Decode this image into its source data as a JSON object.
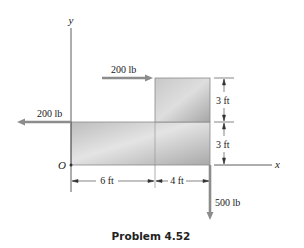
{
  "figure": {
    "caption": "Problem 4.52",
    "axes": {
      "x_label": "x",
      "y_label": "y",
      "origin_label": "O"
    },
    "forces": [
      {
        "id": "top-horizontal",
        "label": "200 lb",
        "direction": "right"
      },
      {
        "id": "left-horizontal",
        "label": "200 lb",
        "direction": "left"
      },
      {
        "id": "bottom-vertical",
        "label": "500 lb",
        "direction": "down"
      }
    ],
    "dimensions": {
      "horizontal": [
        {
          "label": "6 ft"
        },
        {
          "label": "4 ft"
        }
      ],
      "vertical": [
        {
          "label": "3 ft"
        },
        {
          "label": "3 ft"
        }
      ]
    },
    "colors": {
      "plate_light": "#e6e6e6",
      "plate_dark": "#a8a8a8",
      "arrow": "#8c8c8c",
      "line": "#333333"
    }
  }
}
